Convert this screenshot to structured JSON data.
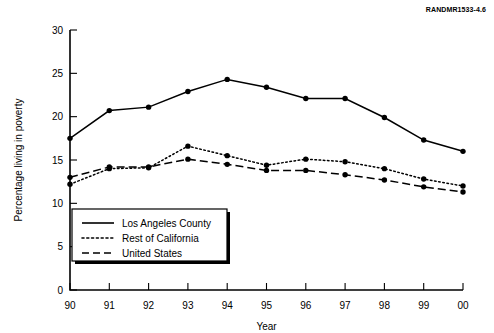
{
  "source_id": "RANDMR1533-4.6",
  "chart_data": {
    "type": "line",
    "title": "",
    "xlabel": "Year",
    "ylabel": "Percentage living in poverty",
    "categories": [
      "90",
      "91",
      "92",
      "93",
      "94",
      "95",
      "96",
      "97",
      "98",
      "99",
      "00"
    ],
    "x": [
      90,
      91,
      92,
      93,
      94,
      95,
      96,
      97,
      98,
      99,
      100
    ],
    "xlim": [
      90,
      100
    ],
    "ylim": [
      0,
      30
    ],
    "yticks": [
      0,
      5,
      10,
      15,
      20,
      25,
      30
    ],
    "ytick_labels": [
      "0",
      "5",
      "10",
      "15",
      "20",
      "25",
      "30"
    ],
    "xtick_labels": [
      "90",
      "91",
      "92",
      "93",
      "94",
      "95",
      "96",
      "97",
      "98",
      "99",
      "00"
    ],
    "grid": false,
    "legend_position": "lower-left-inside",
    "series": [
      {
        "name": "Los Angeles County",
        "style": "solid",
        "values": [
          17.5,
          20.7,
          21.1,
          22.9,
          24.3,
          23.4,
          22.1,
          22.1,
          19.9,
          17.3,
          16.0
        ]
      },
      {
        "name": "Rest of California",
        "style": "dotted",
        "values": [
          12.2,
          14.0,
          14.1,
          16.6,
          15.5,
          14.4,
          15.1,
          14.8,
          14.0,
          12.8,
          12.0
        ]
      },
      {
        "name": "United States",
        "style": "dashed",
        "values": [
          13.0,
          14.2,
          14.2,
          15.1,
          14.5,
          13.8,
          13.8,
          13.3,
          12.7,
          11.9,
          11.3
        ]
      }
    ]
  }
}
